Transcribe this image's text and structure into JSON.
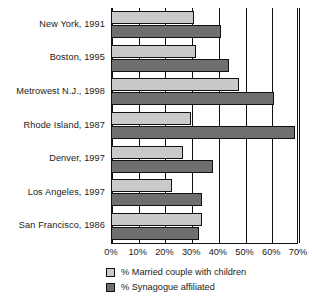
{
  "chart_data": {
    "type": "bar",
    "orientation": "horizontal",
    "title": "",
    "subtitle": "",
    "xlabel": "",
    "ylabel": "",
    "xlim": [
      0,
      70
    ],
    "xticks": [
      "0%",
      "10%",
      "20%",
      "30%",
      "40%",
      "50%",
      "60%",
      "70%"
    ],
    "xtick_values": [
      0,
      10,
      20,
      30,
      40,
      50,
      60,
      70
    ],
    "grid": true,
    "legend_position": "bottom",
    "categories": [
      "New York, 1991",
      "Boston, 1995",
      "Metrowest N.J., 1998",
      "Rhode Island, 1987",
      "Denver, 1997",
      "Los Angeles, 1997",
      "San Francisco, 1986"
    ],
    "series": [
      {
        "name": "% Married couple with children",
        "color": "#c9c9c9",
        "values": [
          31,
          32,
          48,
          30,
          27,
          23,
          34
        ]
      },
      {
        "name": "% Synagogue affiliated",
        "color": "#6f6f6f",
        "values": [
          41,
          44,
          61,
          69,
          38,
          34,
          33
        ]
      }
    ]
  },
  "legend": {
    "items": [
      {
        "label": "% Married couple with children",
        "swatch": "married"
      },
      {
        "label": "% Synagogue affiliated",
        "swatch": "synagogue"
      }
    ]
  },
  "colors": {
    "married": "#c9c9c9",
    "synagogue": "#6f6f6f",
    "axis": "#111111",
    "background": "#ffffff",
    "text": "#1a1a1a"
  }
}
